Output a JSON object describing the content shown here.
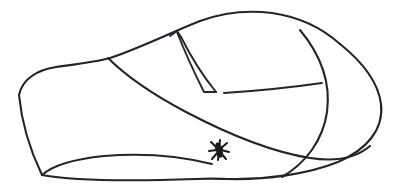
{
  "figure": {
    "title": "Mobius strip with ant",
    "subject": "mobius-strip",
    "style": "hand-drawn line art",
    "background_color": "#ffffff",
    "line_color": "#24242a",
    "line_width_px": 2,
    "canvas": {
      "width": 395,
      "height": 192
    },
    "caption": "",
    "labels": [],
    "annotations": []
  },
  "elements": {
    "band_name": "mobius-band",
    "seam_name": "band-seam-cut",
    "ant_name": "ant",
    "ant_position": {
      "x": 219,
      "y": 150
    },
    "ant_color": "#1b1b1f",
    "ant_leg_count": 8,
    "seam_endpoints": {
      "top_notch": {
        "x": 175,
        "y": 33
      },
      "bottom_meet": {
        "x": 213,
        "y": 92
      }
    },
    "extents": {
      "leftmost_x": 18,
      "rightmost_x": 382,
      "topmost_y": 12,
      "bottommost_y": 180
    }
  },
  "paths": {
    "outer_top_edge": "M 20,93 C 30,78 52,68 82,66 C 128,62 185,34 226,18 C 262,13 300,22 328,44",
    "outer_right_loop": "M 328,44 C 352,60 378,78 381,105 C 383,132 360,152 330,163 C 300,174 262,180 228,179",
    "inner_sweep": "M 82,66 C 118,86 170,112 226,134 C 276,152 318,160 350,152",
    "lower_left_fold": "M 20,93 C 24,118 32,150 44,176 C 56,180 92,172 126,163",
    "bottom_edge": "M 44,176 C 82,180 150,180 228,179",
    "crossing_curve": "M 296,30 C 318,54 330,82 326,112 C 322,140 306,162 282,176",
    "inner_right_edge": "M 222,92 C 258,90 296,86 322,83"
  }
}
